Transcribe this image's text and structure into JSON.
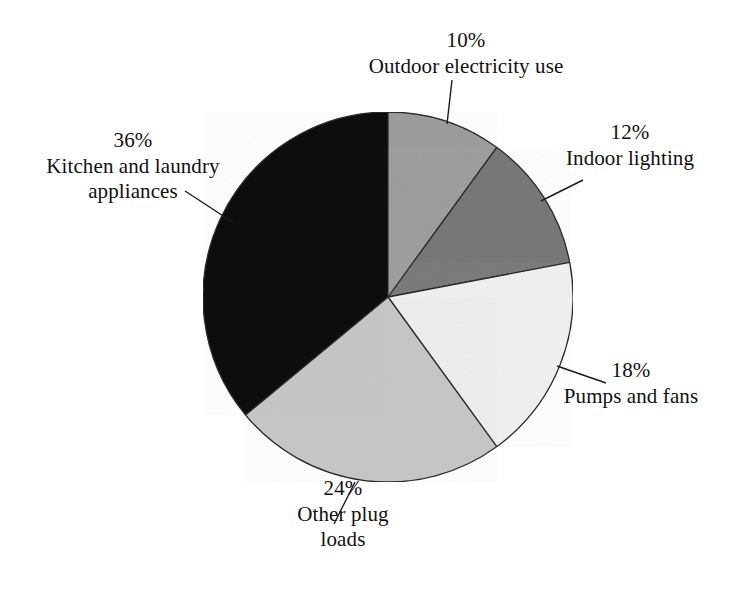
{
  "chart_data": {
    "type": "pie",
    "title": "",
    "subtitle": "",
    "xlabel": "",
    "ylabel": "",
    "legend_position": "none",
    "grid": false,
    "units": "percent",
    "total": 100,
    "start_angle_deg": 0,
    "direction": "clockwise",
    "categories": [
      "Outdoor electricity use",
      "Indoor lighting",
      "Pumps and fans",
      "Other plug loads",
      "Kitchen and laundry appliances"
    ],
    "values": [
      10,
      12,
      18,
      24,
      36
    ],
    "slices": [
      {
        "label": "Outdoor electricity use",
        "value": 10,
        "percent_text": "10%",
        "color": "#9b9b9b",
        "label_lines": [
          "10%",
          "Outdoor electricity use"
        ]
      },
      {
        "label": "Indoor lighting",
        "value": 12,
        "percent_text": "12%",
        "color": "#777777",
        "label_lines": [
          "12%",
          "Indoor lighting"
        ]
      },
      {
        "label": "Pumps and fans",
        "value": 18,
        "percent_text": "18%",
        "color": "#eeeeee",
        "label_lines": [
          "18%",
          "Pumps and fans"
        ]
      },
      {
        "label": "Other plug loads",
        "value": 24,
        "percent_text": "24%",
        "color": "#c5c5c5",
        "label_lines": [
          "24%",
          "Other plug",
          "loads"
        ]
      },
      {
        "label": "Kitchen and laundry appliances",
        "value": 36,
        "percent_text": "36%",
        "color": "#0a0a0a",
        "label_lines": [
          "36%",
          "Kitchen and laundry",
          "appliances"
        ]
      }
    ]
  },
  "labels": {
    "outdoor": {
      "percent": "10%",
      "line1": "Outdoor electricity use"
    },
    "indoor": {
      "percent": "12%",
      "line1": "Indoor lighting"
    },
    "pumps": {
      "percent": "18%",
      "line1": "Pumps and fans"
    },
    "other": {
      "percent": "24%",
      "line1": "Other plug",
      "line2": "loads"
    },
    "kitchen": {
      "percent": "36%",
      "line1": "Kitchen and laundry",
      "line2": "appliances"
    }
  },
  "colors": {
    "background": "#ffffff",
    "text": "#111111",
    "outline": "#2b2b2b",
    "leader": "#1a1a1a",
    "slice_outdoor": "#9b9b9b",
    "slice_indoor": "#777777",
    "slice_pumps": "#eeeeee",
    "slice_other": "#c5c5c5",
    "slice_kitchen": "#0a0a0a"
  }
}
